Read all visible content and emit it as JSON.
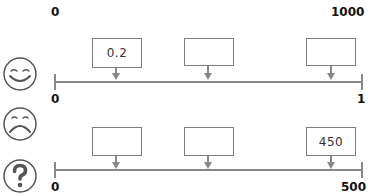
{
  "top_scale": {
    "min_label": "0",
    "max_label": "1000"
  },
  "number_lines": [
    {
      "id": "happy",
      "icon": "smiley-face-icon",
      "min_label": "0",
      "max_label": "1",
      "boxes": [
        {
          "value": "0.2"
        },
        {
          "value": ""
        },
        {
          "value": ""
        }
      ]
    },
    {
      "id": "sad",
      "icon": "sad-face-icon",
      "question_icon": "question-mark-icon",
      "min_label": "0",
      "max_label": "500",
      "boxes": [
        {
          "value": ""
        },
        {
          "value": ""
        },
        {
          "value": "450"
        }
      ]
    }
  ],
  "colors": {
    "line": "#888888",
    "box_border": "#7d7d7d",
    "text": "#111111"
  }
}
